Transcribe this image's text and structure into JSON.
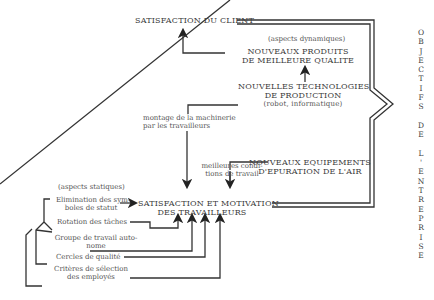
{
  "title_vertical": "OBJECTIFS DE L'ENTREPRISE",
  "vertical_letters": [
    "O",
    "B",
    "J",
    "E",
    "C",
    "T",
    "I",
    "F",
    "S",
    "",
    "D",
    "E",
    "",
    "L",
    "'",
    "E",
    "N",
    "T",
    "R",
    "E",
    "P",
    "R",
    "I",
    "S",
    "E"
  ],
  "nodes": {
    "client": "SATISFACTION DU CLIENT",
    "dynamic_label": "(aspects dynamiques)",
    "products_l1": "NOUVEAUX PRODUITS",
    "products_l2": "DE MEILLEURE QUALITE",
    "tech_l1": "NOUVELLES TECHNOLOGIES",
    "tech_l2": "DE PRODUCTION",
    "tech_l3": "(robot, informatique)",
    "montage_l1": "montage de la machinerie",
    "montage_l2": "par les travailleurs",
    "equip_l1": "NOUVEAUX EQUIPEMENTS",
    "equip_l2": "D'EPURATION DE L'AIR",
    "conditions_l1": "meilleures condi-",
    "conditions_l2": "tions de travail",
    "workers_l1": "SATISFACTION ET MOTIVATION",
    "workers_l2": "DES TRAVAILLEURS",
    "static_label": "(aspects statiques)",
    "elim_l1": "Elimination des sym-",
    "elim_l2": "boles de statut",
    "rotation": "Rotation des tâches",
    "groupe_l1": "Groupe de travail auto-",
    "groupe_l2": "nome",
    "cercles": "Cercles de qualité",
    "criteres_l1": "Critères de sélection",
    "criteres_l2": "des employés"
  },
  "colors": {
    "ink": "#333333",
    "background": "#ffffff"
  }
}
